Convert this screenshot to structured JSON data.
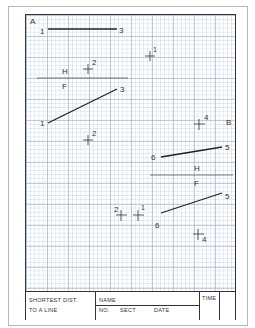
{
  "sheet": {
    "view_a_label": "A",
    "view_b_label": "B",
    "view_a": {
      "top_line": {
        "start": "1",
        "end": "3"
      },
      "top_point": "2",
      "fold_line": {
        "upper": "H",
        "lower": "F"
      },
      "front_line": {
        "start": "1",
        "end": "3"
      },
      "front_point": "2"
    },
    "view_b": {
      "top_point": "4",
      "top_line": {
        "start": "6",
        "end": "5"
      },
      "fold_line": {
        "upper": "H",
        "lower": "F"
      },
      "front_line": {
        "start": "6",
        "end": "5"
      },
      "front_point": "4"
    },
    "extra_points": {
      "p1_top": "1",
      "p1_bottom": "1",
      "p2_bottom": "2"
    }
  },
  "title_block": {
    "title_line1": "SHORTEST DIST.",
    "title_line2": "TO A LINE",
    "name_label": "NAME",
    "no_label": "NO.",
    "sect_label": "SECT",
    "date_label": "DATE",
    "time_label": "TIME"
  },
  "colors": {
    "grid": "#9db0cc",
    "ink": "#222222",
    "border": "#333333"
  }
}
